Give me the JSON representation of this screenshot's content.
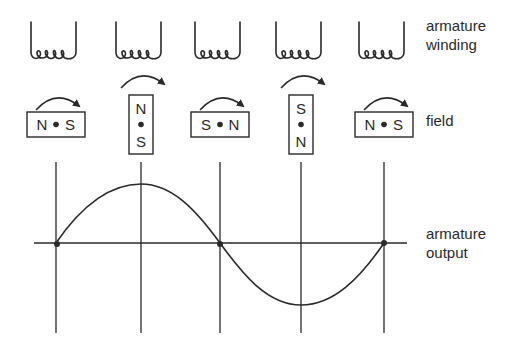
{
  "labels": {
    "winding_line1": "armature",
    "winding_line2": "winding",
    "field": "field",
    "output_line1": "armature",
    "output_line2": "output"
  },
  "positions": [
    {
      "x": 56,
      "coil": "armature-winding",
      "field_orientation": "horizontal",
      "pole_left_or_top": "N",
      "pole_right_or_bottom": "S",
      "output": 0
    },
    {
      "x": 141,
      "coil": "armature-winding",
      "field_orientation": "vertical",
      "pole_left_or_top": "N",
      "pole_right_or_bottom": "S",
      "output": 1
    },
    {
      "x": 220,
      "coil": "armature-winding",
      "field_orientation": "horizontal",
      "pole_left_or_top": "S",
      "pole_right_or_bottom": "N",
      "output": 0
    },
    {
      "x": 301,
      "coil": "armature-winding",
      "field_orientation": "vertical",
      "pole_left_or_top": "S",
      "pole_right_or_bottom": "N",
      "output": -1
    },
    {
      "x": 384,
      "coil": "armature-winding",
      "field_orientation": "horizontal",
      "pole_left_or_top": "N",
      "pole_right_or_bottom": "S",
      "output": 0
    }
  ],
  "poles": {
    "p1_left": "N",
    "p1_right": "S",
    "p2_top": "N",
    "p2_bottom": "S",
    "p3_left": "S",
    "p3_right": "N",
    "p4_top": "S",
    "p4_bottom": "N",
    "p5_left": "N",
    "p5_right": "S"
  },
  "waveform": {
    "type": "sine",
    "cycles": 1,
    "zero_crossings": [
      56,
      220,
      384
    ],
    "peak": {
      "x": 141,
      "value": 1
    },
    "trough": {
      "x": 301,
      "value": -1
    }
  },
  "colors": {
    "ink": "#2a2a2a",
    "background": "#ffffff"
  }
}
